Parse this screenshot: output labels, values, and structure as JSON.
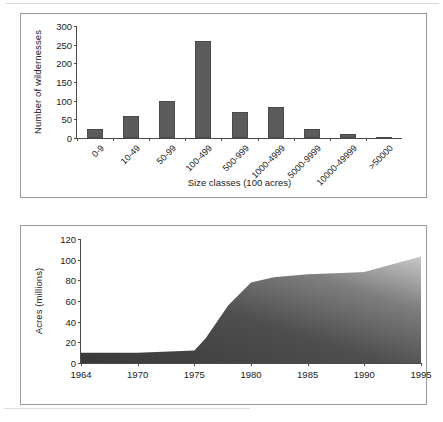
{
  "figures": {
    "bar": {
      "caption_ylabel": "Number of wildernesses",
      "caption_xlabel": "Size classes (100 acres)"
    },
    "area": {
      "caption_ylabel": "Acres (millions)"
    }
  },
  "chart_data": [
    {
      "type": "bar",
      "title": "",
      "xlabel": "Size classes (100 acres)",
      "ylabel": "Number of wildernesses",
      "ylim": [
        0,
        300
      ],
      "yticks": [
        0,
        50,
        100,
        150,
        200,
        250,
        300
      ],
      "grid": false,
      "legend": "none",
      "bar_color": "#5b5b5b",
      "categories": [
        "0-9",
        "10-49",
        "50-99",
        "100-499",
        "500-999",
        "1000-4999",
        "5000-9999",
        "10000-49999",
        ">50000"
      ],
      "values": [
        25,
        60,
        100,
        260,
        70,
        83,
        24,
        12,
        1
      ]
    },
    {
      "type": "area",
      "title": "",
      "xlabel": "",
      "ylabel": "Acres (millions)",
      "ylim": [
        0,
        120
      ],
      "yticks": [
        0,
        20,
        40,
        60,
        80,
        100,
        120
      ],
      "xticks": [
        1964,
        1970,
        1975,
        1980,
        1985,
        1990,
        1995
      ],
      "xlim": [
        1964,
        1995
      ],
      "grid": false,
      "legend": "none",
      "fill_gradient": [
        "#3a3a3a",
        "#b8b8b8"
      ],
      "x": [
        1964,
        1970,
        1975,
        1976,
        1978,
        1980,
        1982,
        1985,
        1988,
        1990,
        1992,
        1995
      ],
      "values": [
        10,
        10,
        12,
        24,
        56,
        78,
        83,
        86,
        87,
        88,
        94,
        103
      ]
    }
  ]
}
